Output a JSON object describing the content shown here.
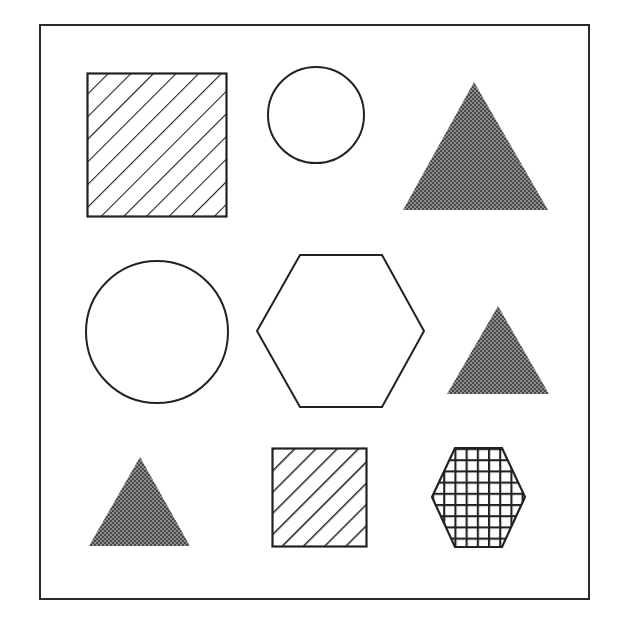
{
  "diagram": {
    "title": "",
    "frame": {
      "x": 40,
      "y": 25,
      "width": 549,
      "height": 574,
      "stroke": "#2a2a2a"
    },
    "colors": {
      "stroke": "#222222",
      "triangle_fill_dark": "#4a4a4a",
      "triangle_fill_light": "#8a8a8a",
      "background": "#ffffff"
    },
    "shapes": [
      {
        "id": "square-large",
        "type": "square",
        "fill": "diagonal-hatch",
        "row": 1,
        "col": 1
      },
      {
        "id": "circle-small",
        "type": "circle",
        "fill": "none",
        "row": 1,
        "col": 2
      },
      {
        "id": "triangle-large",
        "type": "triangle",
        "fill": "crosshatch-gray",
        "row": 1,
        "col": 3
      },
      {
        "id": "circle-large",
        "type": "circle",
        "fill": "none",
        "row": 2,
        "col": 1
      },
      {
        "id": "hexagon-large",
        "type": "hexagon",
        "fill": "none",
        "row": 2,
        "col": 2
      },
      {
        "id": "triangle-medium",
        "type": "triangle",
        "fill": "crosshatch-gray",
        "row": 2,
        "col": 3
      },
      {
        "id": "triangle-small",
        "type": "triangle",
        "fill": "crosshatch-gray",
        "row": 3,
        "col": 1
      },
      {
        "id": "square-small",
        "type": "square",
        "fill": "diagonal-hatch",
        "row": 3,
        "col": 2
      },
      {
        "id": "hexagon-small",
        "type": "hexagon",
        "fill": "grid",
        "row": 3,
        "col": 3
      }
    ]
  }
}
